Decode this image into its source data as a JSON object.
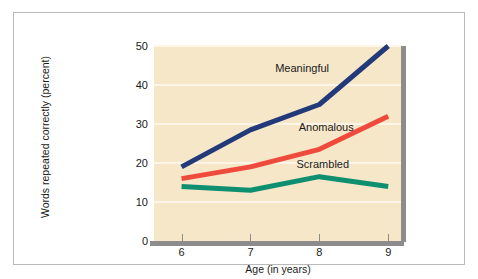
{
  "chart_data": {
    "type": "line",
    "title": "",
    "xlabel": "Age (in years)",
    "ylabel": "Words repeated correctly (percent)",
    "x": [
      6,
      7,
      8,
      9
    ],
    "xtick_labels": [
      "6",
      "7",
      "8",
      "9"
    ],
    "ytick_labels": [
      "0",
      "10",
      "20",
      "30",
      "40",
      "50"
    ],
    "yticks": [
      0,
      10,
      20,
      30,
      40,
      50
    ],
    "xlim": [
      5.6,
      9.2
    ],
    "ylim": [
      0,
      50
    ],
    "grid": "horizontal",
    "legend_position": "inline-annotations",
    "plot_background": "#f7e7c9",
    "series": [
      {
        "name": "Meaningful",
        "color": "#22397a",
        "values": [
          19,
          28.5,
          35,
          50
        ]
      },
      {
        "name": "Anomalous",
        "color": "#ef4b3c",
        "values": [
          16,
          19,
          23.5,
          32
        ]
      },
      {
        "name": "Scrambled",
        "color": "#0e9070",
        "values": [
          14,
          13,
          16.5,
          14
        ]
      }
    ],
    "annotations": [
      {
        "text": "Meaningful",
        "x": 7.75,
        "y": 44
      },
      {
        "text": "Anomalous",
        "x": 8.1,
        "y": 29
      },
      {
        "text": "Scrambled",
        "x": 8.05,
        "y": 19.5
      }
    ]
  },
  "figure": {
    "frame_color": "#b9b9b9",
    "axis_color": "#8c8c8c",
    "text_color": "#1a1a1a"
  }
}
